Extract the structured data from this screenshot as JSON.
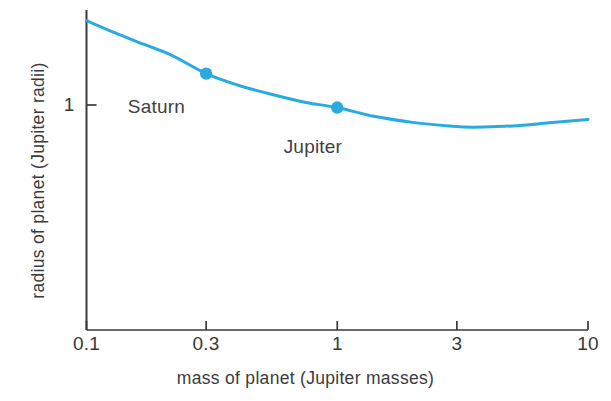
{
  "chart_data": {
    "type": "line",
    "title": "",
    "xlabel": "mass of planet (Jupiter masses)",
    "ylabel": "radius of planet (Jupiter radii)",
    "xscale": "log",
    "yscale": "log",
    "xlim": [
      0.1,
      10
    ],
    "ylim": [
      0.42,
      1.3
    ],
    "grid": false,
    "legend": "none",
    "line_color": "#29abe2",
    "axis_color": "#3a3a3c",
    "xticks": [
      {
        "value": 0.1,
        "label": "0.1"
      },
      {
        "value": 0.3,
        "label": "0.3"
      },
      {
        "value": 1,
        "label": "1"
      },
      {
        "value": 3,
        "label": "3"
      },
      {
        "value": 10,
        "label": "10"
      }
    ],
    "yticks": [
      {
        "value": 0.5,
        "label": "0.5"
      },
      {
        "value": 1,
        "label": "1"
      }
    ],
    "series": [
      {
        "name": "mass-radius relation",
        "x": [
          0.1,
          0.13,
          0.17,
          0.22,
          0.3,
          0.4,
          0.55,
          0.75,
          1.0,
          1.4,
          2.0,
          2.8,
          3.5,
          5.0,
          7.0,
          10.0
        ],
        "y": [
          0.72,
          0.755,
          0.79,
          0.825,
          0.885,
          0.925,
          0.96,
          0.99,
          1.01,
          1.045,
          1.07,
          1.085,
          1.09,
          1.085,
          1.072,
          1.058
        ]
      }
    ],
    "points": [
      {
        "name": "Saturn",
        "label": "Saturn",
        "x": 0.3,
        "y": 0.885
      },
      {
        "name": "Jupiter",
        "label": "Jupiter",
        "x": 1.0,
        "y": 1.01
      }
    ],
    "annotations": [
      {
        "name": "saturn-label",
        "text": "Saturn",
        "x": 0.19,
        "y": 1.01
      },
      {
        "name": "jupiter-label",
        "text": "Jupiter",
        "x": 0.8,
        "y": 1.18
      }
    ]
  }
}
